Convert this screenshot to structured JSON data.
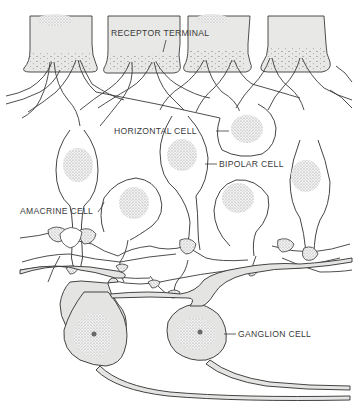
{
  "diagram": {
    "labels": {
      "receptor_terminal": "RECEPTOR TERMINAL",
      "horizontal_cell": "HORIZONTAL CELL",
      "bipolar_cell": "BIPOLAR CELL",
      "amacrine_cell": "AMACRINE CELL",
      "ganglion_cell": "GANGLION CELL"
    },
    "colors": {
      "line": "#3a3a3a",
      "receptor_fill": "#e8e8e6",
      "ganglion_fill": "#e4e4e2",
      "nucleus_stipple": "#9a9a9a",
      "background": "#ffffff"
    }
  }
}
